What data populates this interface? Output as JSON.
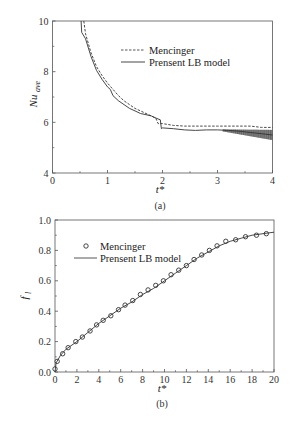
{
  "chart_data": [
    {
      "type": "line",
      "panel": "(a)",
      "caption": "(a)",
      "xlabel": "t*",
      "ylabel": "Nu_ave",
      "xlim": [
        0,
        4
      ],
      "ylim": [
        4,
        10
      ],
      "xticks": [
        "0",
        "1",
        "2",
        "3",
        "4"
      ],
      "yticks": [
        "4",
        "6",
        "8",
        "10"
      ],
      "grid": false,
      "legend_position": "upper right (inside)",
      "series": [
        {
          "name": "Mencinger",
          "style": "dashed",
          "x": [
            0.57,
            0.6,
            0.7,
            0.8,
            0.9,
            1.0,
            1.1,
            1.2,
            1.3,
            1.4,
            1.5,
            1.6,
            1.7,
            1.8,
            1.88,
            1.92,
            2.0,
            2.2,
            2.4,
            2.6,
            2.8,
            3.0,
            3.2,
            3.4,
            3.6,
            3.8,
            4.0
          ],
          "values": [
            10.0,
            9.5,
            8.75,
            8.2,
            7.85,
            7.55,
            7.3,
            7.05,
            6.85,
            6.7,
            6.55,
            6.45,
            6.35,
            6.25,
            6.15,
            5.95,
            5.95,
            5.88,
            5.85,
            5.85,
            5.85,
            5.85,
            5.85,
            5.85,
            5.85,
            5.8,
            5.8
          ]
        },
        {
          "name": "Prensent LB model",
          "style": "solid",
          "x": [
            0.52,
            0.53,
            0.6,
            0.7,
            0.8,
            0.9,
            1.0,
            1.05,
            1.1,
            1.2,
            1.3,
            1.4,
            1.5,
            1.6,
            1.7,
            1.8,
            1.9,
            1.96,
            1.98,
            2.0,
            2.2,
            2.4,
            2.6,
            2.8,
            3.0,
            3.2,
            3.4,
            3.6,
            3.8,
            4.0
          ],
          "values": [
            10.0,
            9.55,
            9.3,
            8.6,
            8.05,
            7.7,
            7.4,
            7.3,
            7.05,
            6.85,
            6.7,
            6.55,
            6.45,
            6.35,
            6.3,
            6.25,
            6.15,
            6.1,
            5.75,
            5.78,
            5.75,
            5.7,
            5.68,
            5.7,
            5.7,
            5.68,
            5.65,
            5.6,
            5.55,
            5.5
          ]
        }
      ]
    },
    {
      "type": "line",
      "panel": "(b)",
      "caption": "(b)",
      "xlabel": "t*",
      "ylabel": "f_l",
      "xlim": [
        0,
        20
      ],
      "ylim": [
        0.0,
        1.0
      ],
      "xticks": [
        "0",
        "2",
        "4",
        "6",
        "8",
        "10",
        "12",
        "14",
        "16",
        "18",
        "20"
      ],
      "yticks": [
        "0.0",
        "0.2",
        "0.4",
        "0.6",
        "0.8",
        "1.0"
      ],
      "grid": false,
      "legend_position": "upper left (inside)",
      "series": [
        {
          "name": "Mencinger",
          "style": "markers (open circles)",
          "x": [
            0.0,
            0.2,
            0.7,
            1.2,
            1.9,
            2.5,
            3.2,
            3.8,
            4.4,
            5.1,
            5.8,
            6.4,
            7.1,
            7.8,
            8.5,
            9.2,
            9.9,
            10.6,
            11.3,
            12.0,
            12.7,
            13.4,
            14.1,
            14.8,
            15.6,
            16.5,
            17.4,
            18.4,
            19.3
          ],
          "values": [
            0.02,
            0.07,
            0.12,
            0.16,
            0.2,
            0.23,
            0.27,
            0.31,
            0.34,
            0.37,
            0.41,
            0.44,
            0.47,
            0.51,
            0.54,
            0.57,
            0.6,
            0.64,
            0.67,
            0.7,
            0.74,
            0.77,
            0.8,
            0.83,
            0.86,
            0.87,
            0.89,
            0.9,
            0.91
          ]
        },
        {
          "name": "Prensent LB model",
          "style": "solid",
          "x": [
            0.0,
            0.1,
            0.5,
            1.0,
            2.0,
            3.0,
            4.0,
            5.0,
            6.0,
            7.0,
            8.0,
            9.0,
            10.0,
            11.0,
            12.0,
            13.0,
            14.0,
            15.0,
            16.0,
            17.0,
            18.0,
            19.0,
            20.0
          ],
          "values": [
            0.0,
            0.06,
            0.11,
            0.15,
            0.2,
            0.26,
            0.32,
            0.37,
            0.42,
            0.46,
            0.51,
            0.55,
            0.6,
            0.65,
            0.7,
            0.75,
            0.79,
            0.83,
            0.86,
            0.88,
            0.9,
            0.91,
            0.92
          ]
        }
      ]
    }
  ],
  "panel_a": {
    "caption": "(a)",
    "xlabel": "t*",
    "ylabel_main": "Nu",
    "ylabel_sub": "ave",
    "legend": {
      "item1": "Mencinger",
      "item2": "Prensent LB model"
    },
    "xticks": [
      "0",
      "1",
      "2",
      "3",
      "4"
    ],
    "yticks": [
      "4",
      "6",
      "8",
      "10"
    ]
  },
  "panel_b": {
    "caption": "(b)",
    "xlabel": "t*",
    "ylabel_main": "f",
    "ylabel_sub": "l",
    "legend": {
      "item1": "Mencinger",
      "item2": "Prensent LB model"
    },
    "xticks": [
      "0",
      "2",
      "4",
      "6",
      "8",
      "10",
      "12",
      "14",
      "16",
      "18",
      "20"
    ],
    "yticks": [
      "0.0",
      "0.2",
      "0.4",
      "0.6",
      "0.8",
      "1.0"
    ]
  },
  "colors": {
    "axis": "#555555",
    "line": "#333333",
    "background": "#ffffff"
  }
}
